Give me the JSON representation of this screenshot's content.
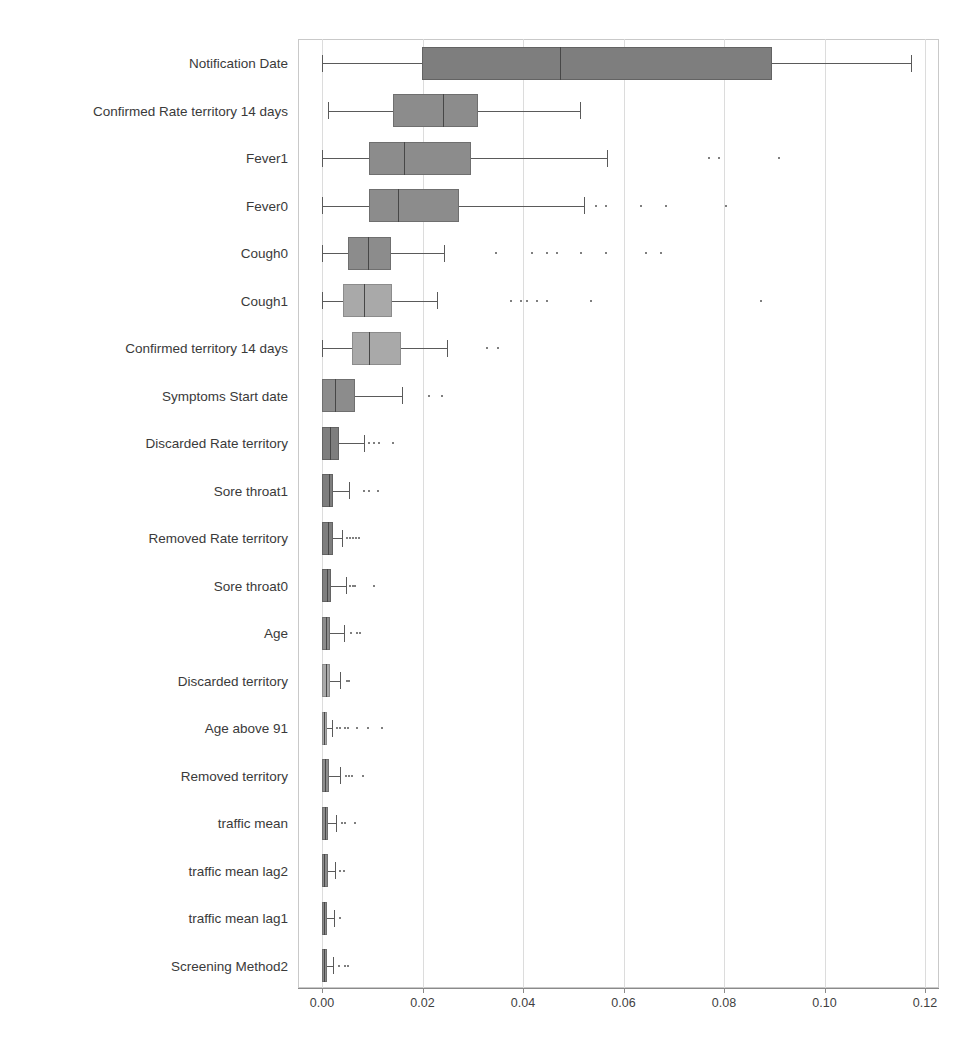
{
  "chart_data": {
    "type": "box",
    "title": "",
    "xlabel": "",
    "ylabel": "",
    "orientation": "horizontal",
    "grid": true,
    "legend": "none",
    "xlim": [
      0.0,
      0.12
    ],
    "xticks": [
      0.0,
      0.02,
      0.04,
      0.06,
      0.08,
      0.1,
      0.12
    ],
    "xtick_labels": [
      "0.00",
      "0.02",
      "0.04",
      "0.06",
      "0.08",
      "0.10",
      "0.12"
    ],
    "categories": [
      "Notification Date",
      "Confirmed Rate territory 14 days",
      "Fever1",
      "Fever0",
      "Cough0",
      "Cough1",
      "Confirmed territory 14 days",
      "Symptoms Start date",
      "Discarded Rate territory",
      "Sore throat1",
      "Removed Rate territory",
      "Sore throat0",
      "Age",
      "Discarded territory",
      "Age above 91",
      "Removed territory",
      "traffic mean",
      "traffic mean lag2",
      "traffic mean lag1",
      "Screening Method2"
    ],
    "boxes": [
      {
        "label": "Notification Date",
        "whisker_low": 0.0,
        "q1": 0.0199,
        "median": 0.0474,
        "q3": 0.0896,
        "whisker_high": 0.1172,
        "fliers": [],
        "shade": "dark"
      },
      {
        "label": "Confirmed Rate territory 14 days",
        "whisker_low": 0.0012,
        "q1": 0.0141,
        "median": 0.0241,
        "q3": 0.0311,
        "whisker_high": 0.0513,
        "fliers": [],
        "shade": "mid"
      },
      {
        "label": "Fever1",
        "whisker_low": 0.0,
        "q1": 0.0094,
        "median": 0.0163,
        "q3": 0.0297,
        "whisker_high": 0.0567,
        "fliers": [
          0.0769,
          0.0789,
          0.0907
        ],
        "shade": "mid"
      },
      {
        "label": "Fever0",
        "whisker_low": 0.0,
        "q1": 0.0094,
        "median": 0.0151,
        "q3": 0.0273,
        "whisker_high": 0.0521,
        "fliers": [
          0.0544,
          0.0564,
          0.0633,
          0.0683,
          0.0802
        ],
        "shade": "mid"
      },
      {
        "label": "Cough0",
        "whisker_low": 0.0,
        "q1": 0.0052,
        "median": 0.0092,
        "q3": 0.0137,
        "whisker_high": 0.0243,
        "fliers": [
          0.0344,
          0.0415,
          0.0445,
          0.0465,
          0.0514,
          0.0563,
          0.0643,
          0.0673
        ],
        "shade": "mid"
      },
      {
        "label": "Cough1",
        "whisker_low": 0.0,
        "q1": 0.0042,
        "median": 0.0084,
        "q3": 0.0139,
        "whisker_high": 0.0229,
        "fliers": [
          0.0375,
          0.0395,
          0.0405,
          0.0425,
          0.0445,
          0.0534,
          0.0872
        ],
        "shade": "light"
      },
      {
        "label": "Confirmed territory 14 days",
        "whisker_low": 0.0,
        "q1": 0.006,
        "median": 0.0094,
        "q3": 0.0157,
        "whisker_high": 0.0249,
        "fliers": [
          0.0326,
          0.0348
        ],
        "shade": "light"
      },
      {
        "label": "Symptoms Start date",
        "whisker_low": 0.0,
        "q1": 0.0,
        "median": 0.0026,
        "q3": 0.0066,
        "whisker_high": 0.0159,
        "fliers": [
          0.0211,
          0.0237
        ],
        "shade": "mid"
      },
      {
        "label": "Discarded Rate territory",
        "whisker_low": 0.0,
        "q1": 0.0,
        "median": 0.0016,
        "q3": 0.0034,
        "whisker_high": 0.0084,
        "fliers": [
          0.0092,
          0.0102,
          0.0112,
          0.0139
        ],
        "shade": "dark"
      },
      {
        "label": "Sore throat1",
        "whisker_low": 0.0,
        "q1": 0.0,
        "median": 0.0014,
        "q3": 0.0022,
        "whisker_high": 0.0054,
        "fliers": [
          0.0082,
          0.0092,
          0.0109
        ],
        "shade": "dark"
      },
      {
        "label": "Removed Rate territory",
        "whisker_low": 0.0,
        "q1": 0.0,
        "median": 0.0012,
        "q3": 0.0022,
        "whisker_high": 0.004,
        "fliers": [
          0.0048,
          0.0054,
          0.006,
          0.0066,
          0.0072
        ],
        "shade": "dark"
      },
      {
        "label": "Sore throat0",
        "whisker_low": 0.0,
        "q1": 0.0,
        "median": 0.001,
        "q3": 0.0018,
        "whisker_high": 0.0048,
        "fliers": [
          0.0054,
          0.006,
          0.0064,
          0.0102
        ],
        "shade": "dark"
      },
      {
        "label": "Age",
        "whisker_low": 0.0,
        "q1": 0.0,
        "median": 0.0008,
        "q3": 0.0016,
        "whisker_high": 0.0044,
        "fliers": [
          0.0056,
          0.0068,
          0.0074
        ],
        "shade": "mid"
      },
      {
        "label": "Discarded territory",
        "whisker_low": 0.0,
        "q1": 0.0,
        "median": 0.0008,
        "q3": 0.0016,
        "whisker_high": 0.0036,
        "fliers": [
          0.0048,
          0.0052
        ],
        "shade": "light"
      },
      {
        "label": "Age above 91",
        "whisker_low": 0.0,
        "q1": 0.0,
        "median": 0.0004,
        "q3": 0.0008,
        "whisker_high": 0.002,
        "fliers": [
          0.0028,
          0.0034,
          0.0044,
          0.005,
          0.0068,
          0.009,
          0.0118
        ],
        "shade": "light"
      },
      {
        "label": "Removed territory",
        "whisker_low": 0.0,
        "q1": 0.0,
        "median": 0.0006,
        "q3": 0.0014,
        "whisker_high": 0.0036,
        "fliers": [
          0.0046,
          0.0052,
          0.0058,
          0.008
        ],
        "shade": "mid"
      },
      {
        "label": "traffic mean",
        "whisker_low": 0.0,
        "q1": 0.0,
        "median": 0.0006,
        "q3": 0.0012,
        "whisker_high": 0.0028,
        "fliers": [
          0.0038,
          0.0044,
          0.0064
        ],
        "shade": "mid"
      },
      {
        "label": "traffic mean lag2",
        "whisker_low": 0.0,
        "q1": 0.0,
        "median": 0.0004,
        "q3": 0.0012,
        "whisker_high": 0.0026,
        "fliers": [
          0.0034,
          0.0042
        ],
        "shade": "mid"
      },
      {
        "label": "traffic mean lag1",
        "whisker_low": 0.0,
        "q1": 0.0,
        "median": 0.0004,
        "q3": 0.001,
        "whisker_high": 0.0024,
        "fliers": [
          0.0034
        ],
        "shade": "mid"
      },
      {
        "label": "Screening Method2",
        "whisker_low": 0.0,
        "q1": 0.0,
        "median": 0.0004,
        "q3": 0.001,
        "whisker_high": 0.0022,
        "fliers": [
          0.0032,
          0.0044,
          0.005
        ],
        "shade": "mid"
      }
    ]
  },
  "style": {
    "box_fill_mid": "#8c8c8c",
    "box_fill_light": "#a9a9a9",
    "box_fill_dark": "#7e7e7e",
    "grid_color": "#dcdcdc",
    "axis_color": "#8a8a8a",
    "text_color": "#3a3a3a"
  }
}
